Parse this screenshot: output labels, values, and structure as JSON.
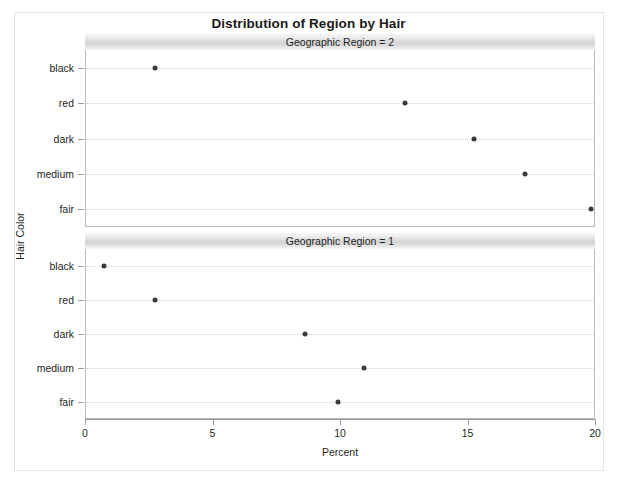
{
  "chart_data": {
    "type": "scatter",
    "title": "Distribution of Region by Hair",
    "xlabel": "Percent",
    "ylabel": "Hair Color",
    "xlim": [
      0,
      20
    ],
    "xticks": [
      0,
      5,
      10,
      15,
      20
    ],
    "xtick_labels": [
      "0",
      "5",
      "10",
      "15",
      "20"
    ],
    "categories": [
      "black",
      "red",
      "dark",
      "medium",
      "fair"
    ],
    "grid": true,
    "legend": "none",
    "panel_variable": "Geographic Region",
    "panels": [
      {
        "header": "Geographic Region = 2",
        "panel_value": "2",
        "points": [
          {
            "category": "black",
            "value": 2.7
          },
          {
            "category": "red",
            "value": 12.5
          },
          {
            "category": "dark",
            "value": 15.2
          },
          {
            "category": "medium",
            "value": 17.2
          },
          {
            "category": "fair",
            "value": 19.8
          }
        ]
      },
      {
        "header": "Geographic Region = 1",
        "panel_value": "1",
        "points": [
          {
            "category": "black",
            "value": 0.7
          },
          {
            "category": "red",
            "value": 2.7
          },
          {
            "category": "dark",
            "value": 8.6
          },
          {
            "category": "medium",
            "value": 10.9
          },
          {
            "category": "fair",
            "value": 9.9
          }
        ]
      }
    ],
    "colors": {
      "marker": "#3a3a3a",
      "gridline": "#cfcfcf",
      "axis": "#9b9b9b",
      "panel_header": "#d6d6d6",
      "frame": "#e3e3e3",
      "text": "#1f1f1f"
    }
  }
}
